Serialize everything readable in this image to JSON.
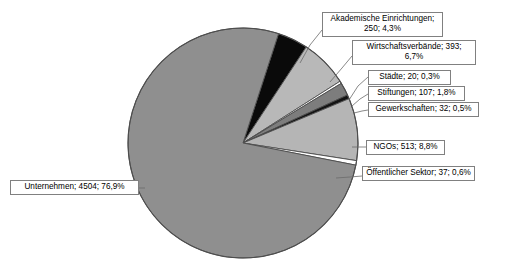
{
  "chart_data": {
    "type": "pie",
    "title": "",
    "xlabel": "",
    "ylabel": "",
    "total": 5856,
    "label_format": "name; value; percent",
    "legend": "none",
    "grid": false,
    "categories": [
      "Unternehmen",
      "NGOs",
      "Wirtschaftsverbände",
      "Akademische Einrichtungen",
      "Stiftungen",
      "Öffentlicher Sektor",
      "Gewerkschaften",
      "Städte"
    ],
    "values": [
      4504,
      513,
      393,
      250,
      107,
      37,
      32,
      20
    ],
    "percents": [
      "76,9%",
      "8,8%",
      "6,7%",
      "4,3%",
      "1,8%",
      "0,6%",
      "0,5%",
      "0,3%"
    ],
    "slices": [
      {
        "name": "Akademische Einrichtungen",
        "value": 250,
        "percent": "4,3%",
        "percent_number": 4.3,
        "color": "#0a0a0a",
        "label_text": "Akademische Einrichtungen; 250; 4,3%"
      },
      {
        "name": "Wirtschaftsverbände",
        "value": 393,
        "percent": "6,7%",
        "percent_number": 6.7,
        "color": "#b8b8b8",
        "label_text": "Wirtschaftsverbände; 393; 6,7%"
      },
      {
        "name": "Städte",
        "value": 20,
        "percent": "0,3%",
        "percent_number": 0.3,
        "color": "#ffffff",
        "label_text": "Städte; 20; 0,3%"
      },
      {
        "name": "Stiftungen",
        "value": 107,
        "percent": "1,8%",
        "percent_number": 1.8,
        "color": "#7d7d7d",
        "label_text": "Stiftungen; 107; 1,8%"
      },
      {
        "name": "Gewerkschaften",
        "value": 32,
        "percent": "0,5%",
        "percent_number": 0.5,
        "color": "#141414",
        "label_text": "Gewerkschaften; 32; 0,5%"
      },
      {
        "name": "NGOs",
        "value": 513,
        "percent": "8,8%",
        "percent_number": 8.8,
        "color": "#b5b5b5",
        "label_text": "NGOs; 513; 8,8%"
      },
      {
        "name": "Öffentlicher Sektor",
        "value": 37,
        "percent": "0,6%",
        "percent_number": 0.6,
        "color": "#ffffff",
        "label_text": "Öffentlicher Sektor; 37; 0,6%"
      },
      {
        "name": "Unternehmen",
        "value": 4504,
        "percent": "76,9%",
        "percent_number": 76.9,
        "color": "#8f8f8f",
        "label_text": "Unternehmen; 4504; 76,9%"
      }
    ]
  },
  "labels": {
    "akademische": "Akademische Einrichtungen; 250; 4,3%",
    "wirtschaft": "Wirtschaftsverbände; 393; 6,7%",
    "staedte": "Städte; 20; 0,3%",
    "stiftungen": "Stiftungen; 107; 1,8%",
    "gewerkschaften": "Gewerkschaften; 32; 0,5%",
    "ngos": "NGOs; 513; 8,8%",
    "oeffentlicher": "Öffentlicher Sektor; 37; 0,6%",
    "unternehmen": "Unternehmen; 4504; 76,9%"
  },
  "style": {
    "background": "#ffffff",
    "outline": "#4d4d4d",
    "leader_line": "#6b6b6b",
    "label_border": "#808080",
    "text_color": "#000000"
  }
}
